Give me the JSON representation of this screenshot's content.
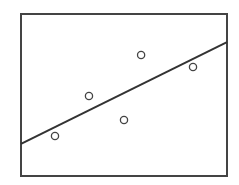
{
  "chart_data": {
    "type": "scatter",
    "title": "",
    "xlabel": "",
    "ylabel": "",
    "xlim": [
      0,
      10
    ],
    "ylim": [
      0,
      10
    ],
    "grid": false,
    "series": [
      {
        "name": "observations",
        "marker": "hollow-circle",
        "points": [
          {
            "x": 1.65,
            "y": 2.47
          },
          {
            "x": 3.3,
            "y": 4.94
          },
          {
            "x": 5.0,
            "y": 3.46
          },
          {
            "x": 5.83,
            "y": 7.47
          },
          {
            "x": 8.35,
            "y": 6.73
          }
        ]
      }
    ],
    "fit_line": {
      "name": "regression-line",
      "start": {
        "x": 0,
        "y": 1.98
      },
      "end": {
        "x": 10,
        "y": 8.27
      }
    },
    "colors": {
      "frame": "#444444",
      "line": "#333333",
      "marker": "#444444"
    }
  }
}
